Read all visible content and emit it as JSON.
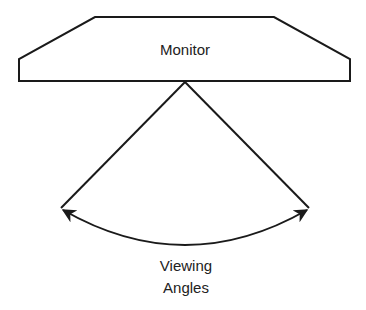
{
  "monitor": {
    "label": "Monitor"
  },
  "viewing": {
    "line1": "Viewing",
    "line2": "Angles"
  },
  "colors": {
    "stroke": "#1a1a1a",
    "background": "#ffffff"
  }
}
